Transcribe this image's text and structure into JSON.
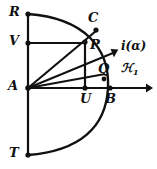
{
  "figure": {
    "kind": "geometry-diagram",
    "width": 157,
    "height": 169,
    "background_color": "#ffffff",
    "stroke_color": "#111111",
    "labels": {
      "R": "R",
      "V": "V",
      "A": "A",
      "T": "T",
      "C": "C",
      "P": "P",
      "U": "U",
      "Q": "Q",
      "B": "B",
      "ray": "i(α)",
      "axis": "ℋ",
      "axis_sub": "1"
    },
    "points": [
      {
        "name": "R",
        "x": 28,
        "y": 14,
        "label_x": 9,
        "label_y": 5
      },
      {
        "name": "V",
        "x": 28,
        "y": 43,
        "label_x": 9,
        "label_y": 34
      },
      {
        "name": "A",
        "x": 28,
        "y": 88,
        "label_x": 8,
        "label_y": 79
      },
      {
        "name": "T",
        "x": 28,
        "y": 155,
        "label_x": 9,
        "label_y": 146
      },
      {
        "name": "C",
        "x": 96,
        "y": 30,
        "label_x": 88,
        "label_y": 12
      },
      {
        "name": "P",
        "x": 85,
        "y": 42,
        "label_x": 90,
        "label_y": 38
      },
      {
        "name": "U",
        "x": 85,
        "y": 88,
        "label_x": 80,
        "label_y": 92
      },
      {
        "name": "Q",
        "x": 104,
        "y": 79,
        "label_x": 99,
        "label_y": 63
      },
      {
        "name": "B",
        "x": 110,
        "y": 88,
        "label_x": 106,
        "label_y": 92
      }
    ],
    "annotations": [
      {
        "name": "ray-label",
        "text": "i(α)",
        "x": 122,
        "y": 41
      },
      {
        "name": "axis-label",
        "text": "ℋ",
        "x": 122,
        "y": 63
      }
    ]
  }
}
